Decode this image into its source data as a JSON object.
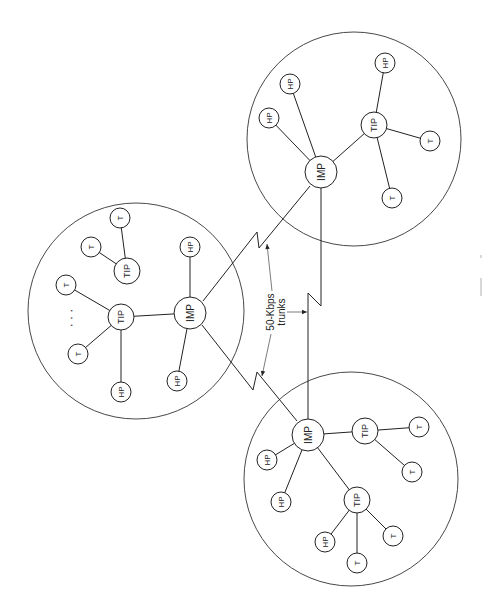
{
  "diagram": {
    "type": "network-topology",
    "width": 483,
    "height": 611,
    "rotation_note": "figure is printed rotated 90 degrees counter-clockwise; all node labels read bottom-to-top",
    "colors": {
      "stroke": "#222222",
      "background": "#ffffff"
    },
    "trunk_label": {
      "line1": "50-Kbps",
      "line2": "trunks",
      "x": 276,
      "y": 312
    },
    "sites": [
      {
        "id": "site-left",
        "circle": {
          "cx": 136,
          "cy": 311,
          "r": 108
        },
        "ellipsis": {
          "label": "· · ·",
          "x": 71,
          "y": 318
        },
        "nodes": [
          {
            "id": "L-IMP",
            "label": "IMP",
            "type": "imp",
            "x": 190,
            "y": 313
          },
          {
            "id": "L-TIP1",
            "label": "TIP",
            "type": "tip",
            "x": 121,
            "y": 317
          },
          {
            "id": "L-TIP2",
            "label": "TIP",
            "type": "tip",
            "x": 127,
            "y": 271
          },
          {
            "id": "L-HP1",
            "label": "HP",
            "type": "host",
            "x": 190,
            "y": 247
          },
          {
            "id": "L-HP2",
            "label": "HP",
            "type": "host",
            "x": 177,
            "y": 381
          },
          {
            "id": "L-HP3",
            "label": "HP",
            "type": "host",
            "x": 121,
            "y": 392
          },
          {
            "id": "L-T1",
            "label": "T",
            "type": "terminal",
            "x": 66,
            "y": 285
          },
          {
            "id": "L-T2",
            "label": "T",
            "type": "terminal",
            "x": 78,
            "y": 354
          },
          {
            "id": "L-T3",
            "label": "T",
            "type": "terminal",
            "x": 91,
            "y": 247
          },
          {
            "id": "L-T4",
            "label": "T",
            "type": "terminal",
            "x": 120,
            "y": 218
          }
        ],
        "edges": [
          [
            "L-IMP",
            "L-TIP1"
          ],
          [
            "L-IMP",
            "L-HP1"
          ],
          [
            "L-IMP",
            "L-HP2"
          ],
          [
            "L-TIP1",
            "L-T1"
          ],
          [
            "L-TIP1",
            "L-T2"
          ],
          [
            "L-TIP1",
            "L-HP3"
          ],
          [
            "L-TIP2",
            "L-T3"
          ],
          [
            "L-TIP2",
            "L-T4"
          ]
        ]
      },
      {
        "id": "site-top-right",
        "circle": {
          "cx": 354,
          "cy": 139,
          "r": 107
        },
        "nodes": [
          {
            "id": "R-IMP",
            "label": "IMP",
            "type": "imp",
            "x": 321,
            "y": 172
          },
          {
            "id": "R-TIP",
            "label": "TIP",
            "type": "tip",
            "x": 374,
            "y": 125
          },
          {
            "id": "R-HP1",
            "label": "HP",
            "type": "host",
            "x": 269,
            "y": 118
          },
          {
            "id": "R-HP2",
            "label": "HP",
            "type": "host",
            "x": 290,
            "y": 84
          },
          {
            "id": "R-HP3",
            "label": "HP",
            "type": "host",
            "x": 385,
            "y": 63
          },
          {
            "id": "R-T1",
            "label": "T",
            "type": "terminal",
            "x": 430,
            "y": 141
          },
          {
            "id": "R-T2",
            "label": "T",
            "type": "terminal",
            "x": 392,
            "y": 198
          }
        ],
        "edges": [
          [
            "R-IMP",
            "R-TIP"
          ],
          [
            "R-IMP",
            "R-HP1"
          ],
          [
            "R-IMP",
            "R-HP2"
          ],
          [
            "R-TIP",
            "R-HP3"
          ],
          [
            "R-TIP",
            "R-T1"
          ],
          [
            "R-TIP",
            "R-T2"
          ]
        ]
      },
      {
        "id": "site-bottom",
        "circle": {
          "cx": 351,
          "cy": 479,
          "r": 107
        },
        "nodes": [
          {
            "id": "B-IMP",
            "label": "IMP",
            "type": "imp",
            "x": 308,
            "y": 435
          },
          {
            "id": "B-TIP1",
            "label": "TIP",
            "type": "tip",
            "x": 365,
            "y": 431
          },
          {
            "id": "B-TIP2",
            "label": "TIP",
            "type": "tip",
            "x": 357,
            "y": 500
          },
          {
            "id": "B-HP1",
            "label": "HP",
            "type": "host",
            "x": 267,
            "y": 460
          },
          {
            "id": "B-HP2",
            "label": "HP",
            "type": "host",
            "x": 281,
            "y": 502
          },
          {
            "id": "B-HP3",
            "label": "HP",
            "type": "host",
            "x": 325,
            "y": 542
          },
          {
            "id": "B-T1",
            "label": "T",
            "type": "terminal",
            "x": 419,
            "y": 427
          },
          {
            "id": "B-T2",
            "label": "T",
            "type": "terminal",
            "x": 412,
            "y": 472
          },
          {
            "id": "B-T3",
            "label": "T",
            "type": "terminal",
            "x": 393,
            "y": 536
          },
          {
            "id": "B-T4",
            "label": "T",
            "type": "terminal",
            "x": 357,
            "y": 563
          }
        ],
        "edges": [
          [
            "B-IMP",
            "B-TIP1"
          ],
          [
            "B-IMP",
            "B-TIP2"
          ],
          [
            "B-IMP",
            "B-HP1"
          ],
          [
            "B-IMP",
            "B-HP2"
          ],
          [
            "B-TIP1",
            "B-T1"
          ],
          [
            "B-TIP1",
            "B-T2"
          ],
          [
            "B-TIP2",
            "B-HP3"
          ],
          [
            "B-TIP2",
            "B-T3"
          ],
          [
            "B-TIP2",
            "B-T4"
          ]
        ]
      }
    ],
    "trunks": [
      {
        "id": "trunk-left-topright",
        "from": "L-IMP",
        "to": "R-IMP",
        "points": [
          [
            203,
            301
          ],
          [
            257,
            232
          ],
          [
            259,
            248
          ],
          [
            310,
            186
          ]
        ]
      },
      {
        "id": "trunk-left-bottom",
        "from": "L-IMP",
        "to": "B-IMP",
        "points": [
          [
            202,
            325
          ],
          [
            253,
            390
          ],
          [
            257,
            372
          ],
          [
            297,
            421
          ]
        ]
      },
      {
        "id": "trunk-topright-bottom",
        "from": "R-IMP",
        "to": "B-IMP",
        "points": [
          [
            321,
            188
          ],
          [
            321,
            306
          ],
          [
            308,
            293
          ],
          [
            308,
            419
          ]
        ]
      }
    ],
    "pointers": [
      {
        "id": "pointer-upper",
        "from": [
          272,
          291
        ],
        "to": [
          267,
          244
        ]
      },
      {
        "id": "pointer-lower",
        "from": [
          271,
          334
        ],
        "to": [
          262,
          376
        ]
      },
      {
        "id": "pointer-right",
        "from": [
          287,
          312
        ],
        "to": [
          307,
          312
        ]
      }
    ],
    "node_styles": {
      "imp": {
        "r": 16,
        "font_size": 10
      },
      "tip": {
        "r": 13,
        "font_size": 9
      },
      "host": {
        "r": 10,
        "font_size": 8
      },
      "terminal": {
        "r": 10,
        "font_size": 8
      }
    }
  }
}
